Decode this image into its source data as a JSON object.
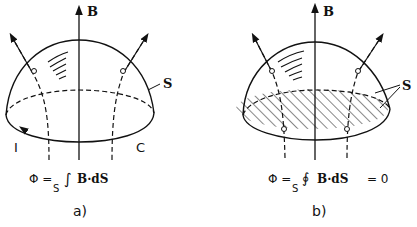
{
  "panel_a": {
    "field_label": "B",
    "surface_label": "S",
    "current_label": "I",
    "contour_label": "C",
    "equation": "Φ = ∫ B · dS",
    "equation_parts": {
      "phi": "Φ =",
      "integral": "∫",
      "subscript": "S",
      "body": "B·dS"
    },
    "caption": "a)"
  },
  "panel_b": {
    "field_label": "B",
    "surface_label": "S",
    "equation": "Φ = ∮ B · dS = 0",
    "equation_parts": {
      "phi": "Φ =",
      "integral": "∮",
      "subscript": "S",
      "body": "B·dS",
      "tail": "= 0"
    },
    "caption": "b)"
  }
}
